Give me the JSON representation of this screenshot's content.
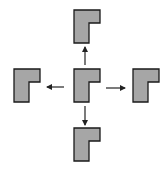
{
  "diagram": {
    "type": "translation-directions",
    "colors": {
      "fill": "#a6a6a6",
      "stroke": "#1a1a1a",
      "arrow": "#222222",
      "background": "#ffffff"
    },
    "shapes": [
      {
        "id": "center",
        "role": "original"
      },
      {
        "id": "up",
        "role": "translated-up"
      },
      {
        "id": "left",
        "role": "translated-left"
      },
      {
        "id": "right",
        "role": "translated-right"
      },
      {
        "id": "down",
        "role": "translated-down"
      }
    ],
    "arrows": [
      "up",
      "left",
      "right",
      "down"
    ]
  }
}
